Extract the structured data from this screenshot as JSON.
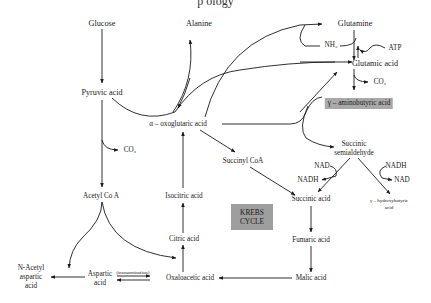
{
  "title_fragment": "p    ology",
  "nodes": {
    "glucose": "Glucose",
    "alanine": "Alanine",
    "glutamine": "Glutamine",
    "nh3": "NH₃",
    "atp": "ATP",
    "glutamic_acid": "Glutamic acid",
    "co2_top": "CO₂",
    "gaba": "γ – aminobutyric acid",
    "pyruvic_acid": "Pyruvic acid",
    "oxoglutaric": "α – oxoglutaric acid",
    "co2_left": "CO₂",
    "succinyl_coa": "Succinyl CoA",
    "succinic_semialdehyde_1": "Succinic",
    "succinic_semialdehyde_2": "semialdehyde",
    "nad_left": "NAD",
    "nadh_left": "NADH",
    "nadh_right": "NADH",
    "nad_right": "NAD",
    "acetyl_coa": "Acetyl Co A",
    "isocitric_acid": "Isocitric acid",
    "succinic_acid": "Succinic acid",
    "hydroxybutyric_1": "γ – hydroxybutyric",
    "hydroxybutyric_2": "acid",
    "citric_acid": "Citric acid",
    "fumaric_acid": "Fumaric acid",
    "n_acetyl_1": "N-Acetyl",
    "n_acetyl_2": "aspartic",
    "n_acetyl_3": "acid",
    "aspartic_1": "Aspartic",
    "aspartic_2": "acid",
    "transamination": "(transamination)",
    "oxaloacetic_acid": "Oxaloacetic acid",
    "malic_acid": "Malic acid"
  },
  "krebs": {
    "line1": "KREBS",
    "line2": "CYCLE",
    "fill": "#9e9e9e"
  },
  "colors": {
    "line": "#1a1a1a",
    "shade": "#a9a9a9"
  }
}
